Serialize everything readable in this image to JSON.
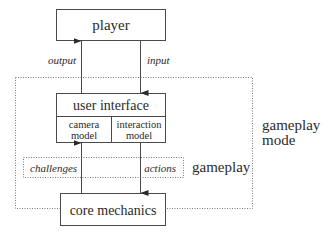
{
  "diagram": {
    "nodes": {
      "player": "player",
      "user_interface": "user interface",
      "camera_model_line1": "camera",
      "camera_model_line2": "model",
      "interaction_model_line1": "interaction",
      "interaction_model_line2": "model",
      "core_mechanics": "core mechanics"
    },
    "edges": {
      "output": "output",
      "input": "input",
      "challenges": "challenges",
      "actions": "actions"
    },
    "groups": {
      "gameplay_mode_line1": "gameplay",
      "gameplay_mode_line2": "mode",
      "gameplay": "gameplay"
    },
    "colors": {
      "stroke": "#4a4a4a",
      "dotted": "#7a7a7a",
      "text": "#2a2a2a"
    }
  }
}
